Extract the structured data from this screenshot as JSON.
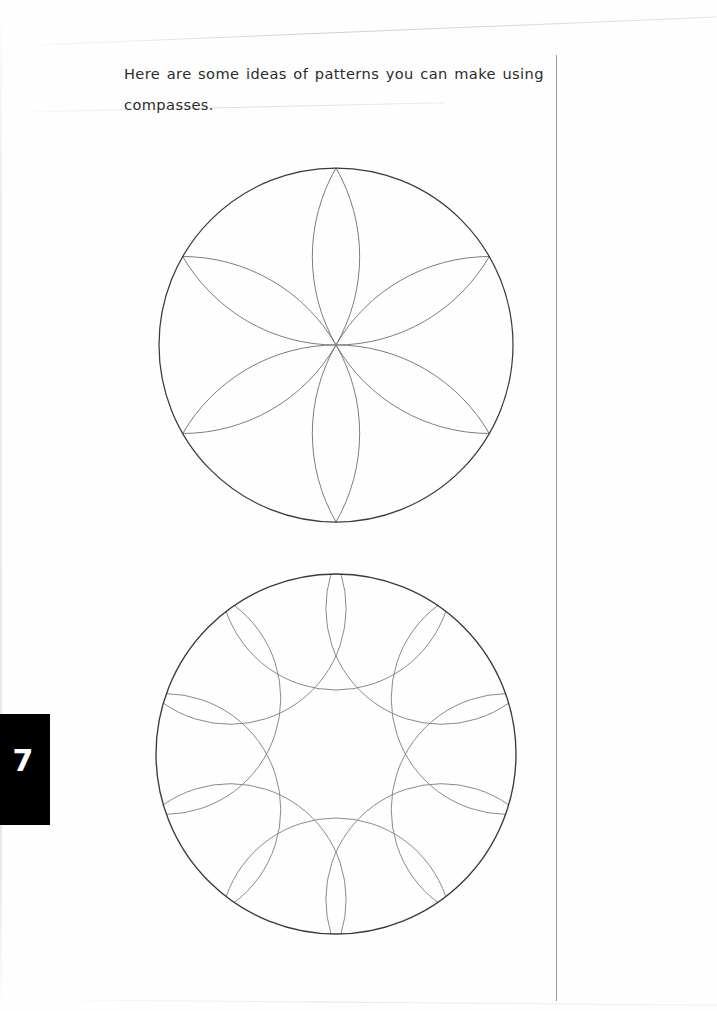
{
  "page": {
    "width": 717,
    "height": 1011,
    "background_color": "#fefefe",
    "paper_tint": "#ffffff"
  },
  "header": {
    "instruction_text": "Here are some ideas of patterns you can make using compasses."
  },
  "page_tab": {
    "number": "7",
    "background_color": "#000000",
    "text_color": "#ffffff"
  },
  "rule": {
    "name": "vertical-margin-rule",
    "color": "#9a9a9e",
    "x": 556,
    "y_start": 55,
    "y_end": 1001
  },
  "figures": [
    {
      "id": "rosette-6",
      "label": "six-petal compass rosette",
      "outer_circle": {
        "cx": 186,
        "cy": 186,
        "r": 177,
        "stroke": "#3a3a3a",
        "stroke_width": 1.25
      },
      "arc_count": 6,
      "arc_radius": 177,
      "arc_stroke": "#7d7d7d",
      "arc_stroke_width": 1.0,
      "start_angle_deg": -90,
      "angle_step_deg": 60
    },
    {
      "id": "rosette-10",
      "label": "ten-arc scalloped compass rosette",
      "outer_circle": {
        "cx": 184,
        "cy": 184,
        "r": 180,
        "stroke": "#3a3a3a",
        "stroke_width": 1.35
      },
      "arc_count": 10,
      "arc_radius": 116,
      "arc_stroke": "#8a8a8a",
      "arc_stroke_width": 1.0,
      "start_angle_deg": -90,
      "angle_step_deg": 36
    }
  ],
  "colors": {
    "ink_dark": "#2b2b2b",
    "outline_dark": "#3a3a3a",
    "arc_grey": "#7d7d7d",
    "rule_grey": "#9a9a9e",
    "tab_black": "#000000"
  }
}
